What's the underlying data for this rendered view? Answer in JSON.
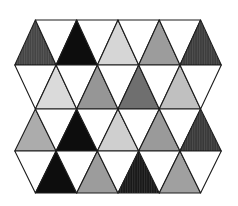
{
  "figure": {
    "type": "triangular-tessellation",
    "background": "#ffffff",
    "line_color": "#1c1c1c",
    "line_width": 1.1,
    "geometry": {
      "row_ys": [
        20,
        65,
        109,
        151,
        193
      ],
      "apex_xs": [
        35.4,
        76.7,
        118.0,
        159.3,
        200.6
      ],
      "base_xs": [
        14.8,
        56.1,
        97.4,
        138.7,
        180.0,
        221.3
      ]
    },
    "rows": [
      {
        "pattern": "UDUDUDUDU",
        "top": "apex_xs",
        "bottom": "base_xs",
        "fills": [
          "#444444",
          "#ffffff",
          "#0d0d0d",
          "#ffffff",
          "#d6d6d6",
          "#ffffff",
          "#9c9c9c",
          "#ffffff",
          "#3c3c3c"
        ]
      },
      {
        "pattern": "DUDUDUDUD",
        "top": "base_xs",
        "bottom": "apex_xs",
        "fills": [
          "#ffffff",
          "#dadada",
          "#ffffff",
          "#969696",
          "#ffffff",
          "#6f6f6f",
          "#ffffff",
          "#c0c0c0",
          "#ffffff"
        ]
      },
      {
        "pattern": "UDUDUDUDU",
        "top": "apex_xs",
        "bottom": "base_xs",
        "fills": [
          "#acacac",
          "#ffffff",
          "#0d0d0d",
          "#ffffff",
          "#cfcfcf",
          "#ffffff",
          "#9a9a9a",
          "#ffffff",
          "#383838"
        ]
      },
      {
        "pattern": "DUDUDUDUD",
        "top": "base_xs",
        "bottom": "apex_xs",
        "fills": [
          "#ffffff",
          "#0d0d0d",
          "#ffffff",
          "#9c9c9c",
          "#ffffff",
          "#181818",
          "#ffffff",
          "#a0a0a0",
          "#ffffff"
        ]
      }
    ],
    "hatched_cells": [
      [
        0,
        0
      ],
      [
        0,
        8
      ],
      [
        2,
        8
      ],
      [
        3,
        5
      ]
    ]
  }
}
